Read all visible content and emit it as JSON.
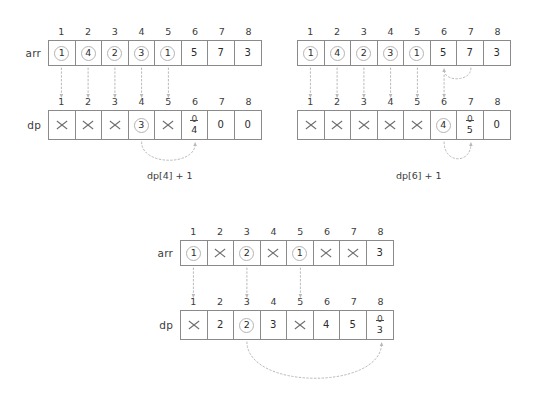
{
  "diagram": {
    "title": "Dynamic programming dp array update illustration",
    "colors": {
      "box_border": "#8a8a8a",
      "text": "#3c3c3c",
      "connector": "#b9b9b9",
      "circle_highlight": "#b4b4b4"
    },
    "indices": [
      "1",
      "2",
      "3",
      "4",
      "5",
      "6",
      "7",
      "8"
    ],
    "panels": [
      {
        "id": "panel-top-left",
        "rows": [
          {
            "id": "arr-row",
            "label": "arr",
            "cells": [
              {
                "value": "1",
                "style": "circled"
              },
              {
                "value": "4",
                "style": "circled"
              },
              {
                "value": "2",
                "style": "circled"
              },
              {
                "value": "3",
                "style": "circled"
              },
              {
                "value": "1",
                "style": "circled"
              },
              {
                "value": "5",
                "style": "plain"
              },
              {
                "value": "7",
                "style": "plain"
              },
              {
                "value": "3",
                "style": "plain"
              }
            ]
          },
          {
            "id": "dp-row",
            "label": "dp",
            "cells": [
              {
                "value": "",
                "style": "crossed"
              },
              {
                "value": "",
                "style": "crossed"
              },
              {
                "value": "",
                "style": "crossed"
              },
              {
                "value": "3",
                "style": "circled"
              },
              {
                "value": "",
                "style": "crossed"
              },
              {
                "old": "0",
                "value": "4",
                "style": "stacked"
              },
              {
                "value": "0",
                "style": "plain"
              },
              {
                "value": "0",
                "style": "plain"
              }
            ]
          }
        ],
        "caption": "dp[4] + 1"
      },
      {
        "id": "panel-top-right",
        "rows": [
          {
            "id": "arr-row",
            "label": "",
            "cells": [
              {
                "value": "1",
                "style": "circled"
              },
              {
                "value": "4",
                "style": "circled"
              },
              {
                "value": "2",
                "style": "circled"
              },
              {
                "value": "3",
                "style": "circled"
              },
              {
                "value": "1",
                "style": "circled"
              },
              {
                "value": "5",
                "style": "plain"
              },
              {
                "value": "7",
                "style": "plain"
              },
              {
                "value": "3",
                "style": "plain"
              }
            ]
          },
          {
            "id": "dp-row",
            "label": "",
            "cells": [
              {
                "value": "",
                "style": "crossed"
              },
              {
                "value": "",
                "style": "crossed"
              },
              {
                "value": "",
                "style": "crossed"
              },
              {
                "value": "",
                "style": "crossed"
              },
              {
                "value": "",
                "style": "crossed"
              },
              {
                "value": "4",
                "style": "circled"
              },
              {
                "old": "0",
                "value": "5",
                "style": "stacked"
              },
              {
                "value": "0",
                "style": "plain"
              }
            ]
          }
        ],
        "caption": "dp[6] + 1"
      },
      {
        "id": "panel-bottom",
        "rows": [
          {
            "id": "arr-row",
            "label": "arr",
            "cells": [
              {
                "value": "1",
                "style": "circled"
              },
              {
                "value": "",
                "style": "crossed"
              },
              {
                "value": "2",
                "style": "circled"
              },
              {
                "value": "",
                "style": "crossed"
              },
              {
                "value": "1",
                "style": "circled"
              },
              {
                "value": "",
                "style": "crossed"
              },
              {
                "value": "",
                "style": "crossed"
              },
              {
                "value": "3",
                "style": "plain"
              }
            ]
          },
          {
            "id": "dp-row",
            "label": "dp",
            "cells": [
              {
                "value": "",
                "style": "crossed"
              },
              {
                "value": "2",
                "style": "plain"
              },
              {
                "value": "2",
                "style": "circled"
              },
              {
                "value": "3",
                "style": "plain"
              },
              {
                "value": "",
                "style": "crossed"
              },
              {
                "value": "4",
                "style": "plain"
              },
              {
                "value": "5",
                "style": "plain"
              },
              {
                "old": "0",
                "value": "3",
                "style": "stacked"
              }
            ]
          }
        ],
        "caption": ""
      }
    ]
  }
}
